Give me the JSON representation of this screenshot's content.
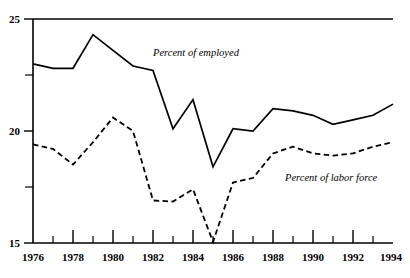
{
  "chart_data": {
    "type": "line",
    "title": "",
    "subtitle": "",
    "xlabel": "",
    "ylabel": "",
    "x": [
      1976,
      1977,
      1978,
      1979,
      1980,
      1981,
      1982,
      1983,
      1984,
      1985,
      1986,
      1987,
      1988,
      1989,
      1990,
      1991,
      1992,
      1993,
      1994
    ],
    "xlim": [
      1976,
      1994
    ],
    "ylim": [
      15,
      25
    ],
    "y_ticks_major": [
      15,
      20,
      25
    ],
    "y_ticks_minor": [
      17.5,
      22.5
    ],
    "x_ticks_major": [
      1976,
      1978,
      1980,
      1982,
      1984,
      1986,
      1988,
      1990,
      1992,
      1994
    ],
    "x_ticks_minor": [
      1977,
      1979,
      1981,
      1983,
      1985,
      1987,
      1989,
      1991,
      1993
    ],
    "grid": false,
    "legend_position": "inline-annotation",
    "series": [
      {
        "name": "Percent of employed",
        "style": "solid",
        "color": "#000000",
        "values": [
          23.0,
          22.8,
          22.8,
          24.3,
          23.6,
          22.9,
          22.7,
          20.1,
          21.4,
          18.4,
          20.1,
          20.0,
          21.0,
          20.9,
          20.7,
          20.3,
          20.5,
          20.7,
          21.2
        ]
      },
      {
        "name": "Percent of labor force",
        "style": "dashed",
        "color": "#000000",
        "values": [
          19.4,
          19.2,
          18.5,
          19.5,
          20.6,
          20.0,
          16.9,
          16.85,
          17.4,
          15.05,
          17.7,
          17.9,
          19.0,
          19.3,
          19.0,
          18.9,
          19.0,
          19.3,
          19.5
        ]
      }
    ],
    "annotations": [
      {
        "text": "Percent of employed",
        "x": 1982.0,
        "y": 23.35
      },
      {
        "text": "Percent of labor force",
        "x": 1988.6,
        "y": 17.75
      }
    ]
  },
  "axis": {
    "y_labels": [
      "25",
      "20",
      "15"
    ],
    "x_labels": [
      "1976",
      "1978",
      "1980",
      "1982",
      "1984",
      "1986",
      "1988",
      "1990",
      "1992",
      "1994"
    ]
  },
  "labels": {
    "series_employed": "Percent of employed",
    "series_labor_force": "Percent of labor force"
  }
}
